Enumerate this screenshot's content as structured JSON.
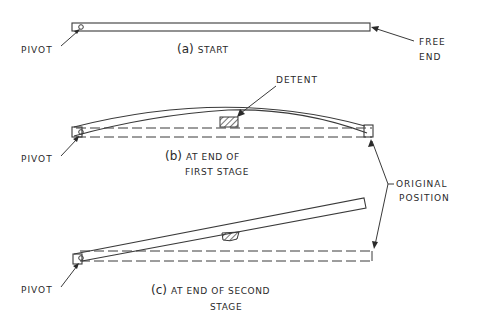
{
  "diagram": {
    "type": "mechanism-stages",
    "panels": [
      {
        "id": "a",
        "tag": "(a)",
        "caption_line1": "START",
        "caption_line2": "",
        "labels": {
          "pivot": "PIVOT",
          "free_end_line1": "FREE",
          "free_end_line2": "END"
        }
      },
      {
        "id": "b",
        "tag": "(b)",
        "caption_line1": "AT END OF",
        "caption_line2": "FIRST STAGE",
        "labels": {
          "pivot": "PIVOT",
          "detent": "DETENT"
        }
      },
      {
        "id": "c",
        "tag": "(c)",
        "caption_line1": "AT END OF SECOND",
        "caption_line2": "STAGE",
        "labels": {
          "pivot": "PIVOT"
        }
      }
    ],
    "shared_labels": {
      "original_position_line1": "ORIGINAL",
      "original_position_line2": "POSITION"
    },
    "colors": {
      "ink": "#3a3a3a",
      "background": "#ffffff"
    }
  }
}
